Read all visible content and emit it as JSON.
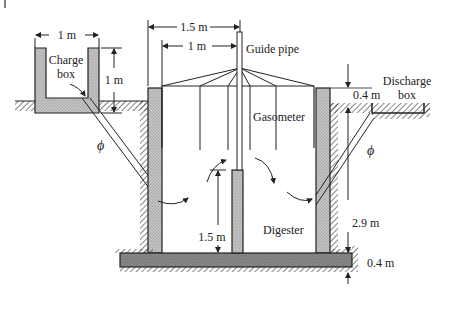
{
  "labels": {
    "charge_box": [
      "Charge",
      "box"
    ],
    "discharge_box": [
      "Discharge",
      "box"
    ],
    "guide_pipe": "Guide pipe",
    "gasometer": "Gasometer",
    "digester": "Digester",
    "inlet_angle": "ϕ",
    "outlet_angle": "ϕ"
  },
  "dimensions": {
    "charge_box_width": "1 m",
    "charge_box_height": "1 m",
    "digester_radius": "1.5 m",
    "gasometer_radius": "1 m",
    "discharge_offset": "0.4 m",
    "partition_height": "1.5 m",
    "digester_depth": "2.9 m",
    "base_thickness": "0.4 m"
  },
  "colors": {
    "line": "#222222",
    "wall_fill": "#b8b8b8",
    "base_fill": "#8a8a8a",
    "background": "#ffffff"
  }
}
